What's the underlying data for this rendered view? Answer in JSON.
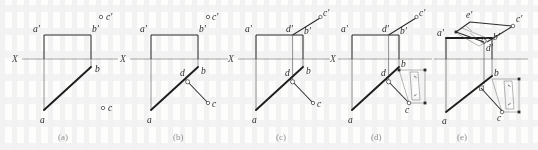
{
  "figure": {
    "caption_style": "lowercase letters in parentheses",
    "background_color": "#fdfdfc",
    "line_color_thick": "#1d1d1d",
    "line_color_thin": "#5d5d5d",
    "axis_color": "#8a8a8a",
    "label_color": "#2b2b2b",
    "caption_color": "#8f8f93"
  },
  "panels": [
    {
      "id": "panel-a",
      "caption": "(a)",
      "axis_label": "X",
      "point_labels": [
        "a'",
        "b'",
        "c'",
        "b",
        "a",
        "c"
      ],
      "description": "Given: frontal projection rectangle a'b' with X axis, horizontal projection a-b, and isolated points c' and c"
    },
    {
      "id": "panel-b",
      "caption": "(b)",
      "axis_label": "X",
      "point_labels": [
        "a'",
        "b'",
        "c'",
        "d",
        "b",
        "a",
        "c"
      ],
      "description": "Perpendicular dropped from c to line ab in the horizontal projection giving foot d with right-angle marker"
    },
    {
      "id": "panel-c",
      "caption": "(c)",
      "axis_label": "X",
      "point_labels": [
        "a'",
        "d'",
        "b'",
        "c'",
        "d",
        "b",
        "a",
        "c"
      ],
      "description": "Projector carried up from d to the frontal projection giving d', then line d'c' drawn"
    },
    {
      "id": "panel-d",
      "caption": "(d)",
      "axis_label": "X",
      "point_labels": [
        "a'",
        "d'",
        "b'",
        "c'",
        "d",
        "b",
        "a",
        "c"
      ],
      "description": "True-length / true-distance auxiliary rectangle constructed on bc in the horizontal projection"
    },
    {
      "id": "panel-e",
      "caption": "(e)",
      "axis_label": "",
      "point_labels": [
        "e'",
        "c'",
        "a'",
        "b'",
        "d'",
        "b",
        "a",
        "c"
      ],
      "description": "Revolved auxiliary view completed in the frontal projection locating e' with the transferred true distance"
    }
  ],
  "annotations": {
    "right_angle_marker": "right-angle-square",
    "equal_measure_mark": "tick",
    "axis_name": "X"
  }
}
